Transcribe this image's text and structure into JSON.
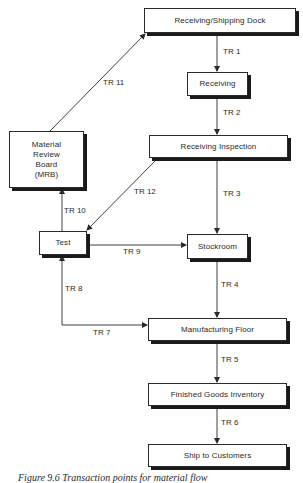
{
  "diagram": {
    "type": "flowchart",
    "nodes": {
      "dock": {
        "label": "Receiving/Shipping Dock"
      },
      "receiving": {
        "label": "Receiving"
      },
      "inspection": {
        "label": "Receiving Inspection"
      },
      "mrb": {
        "lines": [
          "Material",
          "Review",
          "Board",
          "(MRB)"
        ]
      },
      "test": {
        "label": "Test"
      },
      "stockroom": {
        "label": "Stockroom"
      },
      "manufacturing": {
        "label": "Manufacturing Floor"
      },
      "finished_goods": {
        "label": "Finished Goods Inventory"
      },
      "ship": {
        "label": "Ship to Customers"
      }
    },
    "edges": [
      {
        "id": "tr1",
        "label": "TR 1",
        "from": "Receiving/Shipping Dock",
        "to": "Receiving"
      },
      {
        "id": "tr2",
        "label": "TR 2",
        "from": "Receiving",
        "to": "Receiving Inspection"
      },
      {
        "id": "tr3",
        "label": "TR 3",
        "from": "Receiving Inspection",
        "to": "Stockroom"
      },
      {
        "id": "tr4",
        "label": "TR 4",
        "from": "Stockroom",
        "to": "Manufacturing Floor"
      },
      {
        "id": "tr5",
        "label": "TR 5",
        "from": "Manufacturing Floor",
        "to": "Finished Goods Inventory"
      },
      {
        "id": "tr6",
        "label": "TR 6",
        "from": "Finished Goods Inventory",
        "to": "Ship to Customers"
      },
      {
        "id": "tr7",
        "label": "TR 7",
        "from": "Test",
        "to": "Manufacturing Floor"
      },
      {
        "id": "tr8",
        "label": "TR 8",
        "from": "Manufacturing Floor",
        "to": "Test"
      },
      {
        "id": "tr9",
        "label": "TR 9",
        "from": "Test",
        "to": "Stockroom"
      },
      {
        "id": "tr10",
        "label": "TR 10",
        "from": "Test",
        "to": "Material Review Board (MRB)"
      },
      {
        "id": "tr11",
        "label": "TR 11",
        "from": "Material Review Board (MRB)",
        "to": "Receiving/Shipping Dock"
      },
      {
        "id": "tr12",
        "label": "TR 12",
        "from": "Receiving Inspection",
        "to": "Test"
      }
    ],
    "caption": "Figure 9.6  Transaction points for material flow"
  },
  "colors": {
    "line": "#2a2a2a",
    "shadow": "#1a1a1a",
    "background": "#ffffff"
  }
}
